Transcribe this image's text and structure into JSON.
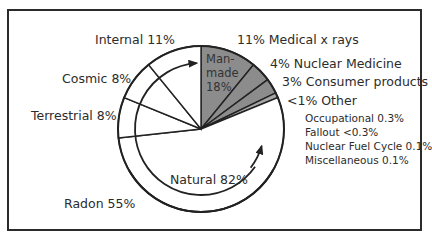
{
  "chart_data": {
    "type": "pie",
    "title": "",
    "groups": [
      {
        "name": "Natural",
        "label": "Natural 82%",
        "value": 82
      },
      {
        "name": "Man-made",
        "label": "Man-made 18%",
        "value": 18
      }
    ],
    "slices": [
      {
        "label": "Radon 55%",
        "name": "Radon",
        "value": 55,
        "group": "Natural",
        "color": "#ffffff"
      },
      {
        "label": "Terrestrial 8%",
        "name": "Terrestrial",
        "value": 8,
        "group": "Natural",
        "color": "#ffffff"
      },
      {
        "label": "Cosmic 8%",
        "name": "Cosmic",
        "value": 8,
        "group": "Natural",
        "color": "#ffffff"
      },
      {
        "label": "Internal 11%",
        "name": "Internal",
        "value": 11,
        "group": "Natural",
        "color": "#ffffff"
      },
      {
        "label": "11% Medical x rays",
        "name": "Medical x rays",
        "value": 11,
        "group": "Man-made",
        "color": "#8c8c8c"
      },
      {
        "label": "4% Nuclear Medicine",
        "name": "Nuclear Medicine",
        "value": 4,
        "group": "Man-made",
        "color": "#8c8c8c"
      },
      {
        "label": "3% Consumer products",
        "name": "Consumer products",
        "value": 3,
        "group": "Man-made",
        "color": "#8c8c8c"
      },
      {
        "label": "<1% Other",
        "name": "Other",
        "value": 1,
        "group": "Man-made",
        "color": "#a6a6a6"
      }
    ],
    "other_breakdown": [
      {
        "label": "Occupational 0.3%",
        "name": "Occupational",
        "value": 0.3
      },
      {
        "label": "Fallout <0.3%",
        "name": "Fallout",
        "value": 0.3
      },
      {
        "label": "Nuclear Fuel Cycle 0.1%",
        "name": "Nuclear Fuel Cycle",
        "value": 0.1
      },
      {
        "label": "Miscellaneous 0.1%",
        "name": "Miscellaneous",
        "value": 0.1
      }
    ],
    "legend": "none (direct labels)"
  },
  "labels": {
    "internal": "Internal 11%",
    "cosmic": "Cosmic 8%",
    "terrestrial": "Terrestrial 8%",
    "radon": "Radon 55%",
    "natural": "Natural 82%",
    "manmade_line1": "Man-",
    "manmade_line2": "made",
    "manmade_line3": "18%",
    "medical": "11% Medical x rays",
    "nuclear_medicine": "4% Nuclear Medicine",
    "consumer": "3% Consumer products",
    "other": "<1% Other",
    "occupational": "Occupational 0.3%",
    "fallout": "Fallout <0.3%",
    "fuel_cycle": "Nuclear Fuel Cycle 0.1%",
    "misc": "Miscellaneous 0.1%"
  }
}
